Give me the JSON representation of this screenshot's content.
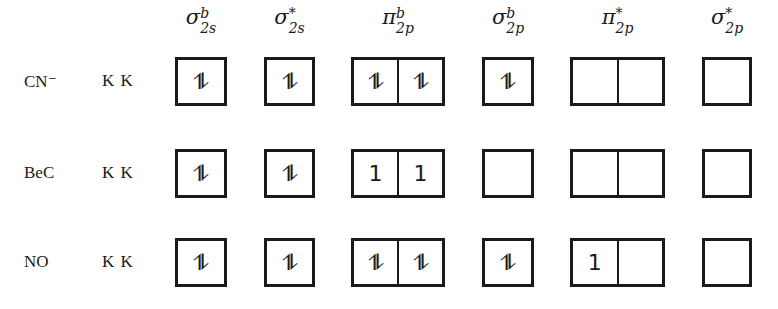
{
  "orbitals": [
    {
      "id": "sigma_2s_b",
      "symbol": "σ",
      "sup": "b",
      "sub": "2s",
      "cells": 1,
      "left": 175,
      "width": 52
    },
    {
      "id": "sigma_2s_star",
      "symbol": "σ",
      "sup": "*",
      "sub": "2s",
      "cells": 1,
      "left": 264,
      "width": 51
    },
    {
      "id": "pi_2p_b",
      "symbol": "π",
      "sup": "b",
      "sub": "2p",
      "cells": 2,
      "left": 351,
      "width": 94
    },
    {
      "id": "sigma_2p_b",
      "symbol": "σ",
      "sup": "b",
      "sub": "2p",
      "cells": 1,
      "left": 482,
      "width": 52
    },
    {
      "id": "pi_2p_star",
      "symbol": "π",
      "sup": "*",
      "sub": "2p",
      "cells": 2,
      "left": 570,
      "width": 95
    },
    {
      "id": "sigma_2p_star",
      "symbol": "σ",
      "sup": "*",
      "sub": "2p",
      "cells": 1,
      "left": 702,
      "width": 50
    }
  ],
  "rows": [
    {
      "molecule": "CN⁻",
      "core": "K K",
      "top": 57,
      "occupancy": [
        [
          "⥮"
        ],
        [
          "⥮"
        ],
        [
          "⥮",
          "⥮"
        ],
        [
          "⥮"
        ],
        [
          "",
          ""
        ],
        [
          ""
        ]
      ]
    },
    {
      "molecule": "BeC",
      "core": "K K",
      "top": 149,
      "occupancy": [
        [
          "⥮"
        ],
        [
          "⥮"
        ],
        [
          "1",
          "1"
        ],
        [
          ""
        ],
        [
          "",
          ""
        ],
        [
          ""
        ]
      ]
    },
    {
      "molecule": "NO",
      "core": "K K",
      "top": 238,
      "occupancy": [
        [
          "⥮"
        ],
        [
          "⥮"
        ],
        [
          "⥮",
          "⥮"
        ],
        [
          "⥮"
        ],
        [
          "1",
          ""
        ],
        [
          ""
        ]
      ]
    }
  ]
}
